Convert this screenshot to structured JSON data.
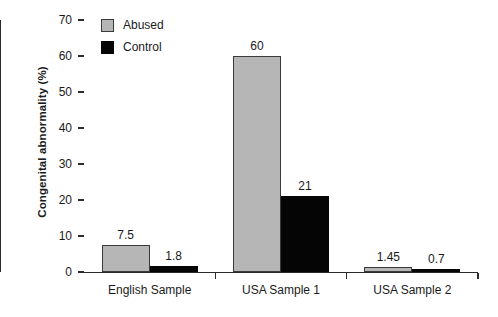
{
  "chart_data": {
    "type": "bar",
    "title": "",
    "xlabel": "",
    "ylabel": "Congenital abnormality (%)",
    "ylim": [
      0,
      70
    ],
    "yticks": [
      0,
      10,
      20,
      30,
      40,
      50,
      60,
      70
    ],
    "ytick_labels": [
      "0",
      "10",
      "20",
      "30",
      "40",
      "50",
      "60",
      "70"
    ],
    "grid": false,
    "legend_position": "top-left",
    "categories": [
      "English Sample",
      "USA Sample 1",
      "USA Sample 2"
    ],
    "series": [
      {
        "name": "Abused",
        "color": "#b6b6b6",
        "values": [
          7.5,
          60,
          1.45
        ],
        "labels": [
          "7.5",
          "60",
          "1.45"
        ]
      },
      {
        "name": "Control",
        "color": "#050505",
        "values": [
          1.8,
          21,
          0.7
        ],
        "labels": [
          "1.8",
          "21",
          "0.7"
        ]
      }
    ]
  },
  "legend": {
    "items": [
      {
        "label": "Abused",
        "color": "#b6b6b6"
      },
      {
        "label": "Control",
        "color": "#050505"
      }
    ]
  },
  "axis": {
    "y_title": "Congenital abnormality (%)"
  }
}
